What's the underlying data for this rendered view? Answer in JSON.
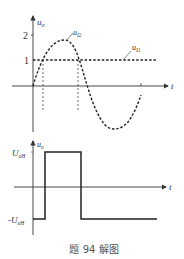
{
  "top_plot": {
    "y_axis_label": "u",
    "y_axis_label_sub": "o",
    "x_axis_label": "t",
    "y_ticks": [
      "2",
      "1"
    ],
    "curve_labels": {
      "sine": {
        "main": "u",
        "sub": "I2"
      },
      "level": {
        "main": "u",
        "sub": "I1"
      }
    }
  },
  "bottom_plot": {
    "y_axis_label": "u",
    "y_axis_label_sub": "o",
    "x_axis_label": "t",
    "high_label": "U",
    "high_label_sub": "oH",
    "low_label": "-U",
    "low_label_sub": "oH"
  },
  "caption": "题 94 解图",
  "colors": {
    "axis": "#333333",
    "curve": "#222222"
  }
}
